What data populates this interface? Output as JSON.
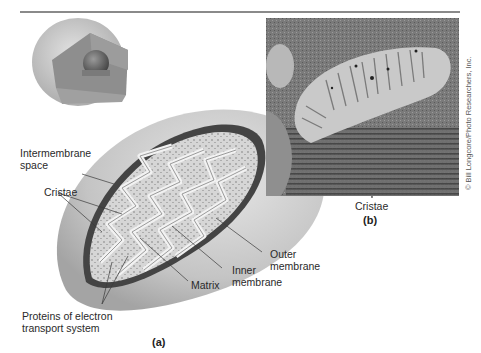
{
  "figure": {
    "panels": [
      {
        "id": "a",
        "label": "(a)",
        "type": "illustration",
        "subject": "mitochondrion cutaway",
        "labels": {
          "intermembrane_space_line1": "Intermembrane",
          "intermembrane_space_line2": "space",
          "cristae": "Cristae",
          "proteins_line1": "Proteins of electron",
          "proteins_line2": "transport system",
          "matrix": "Matrix",
          "inner_membrane_line1": "Inner",
          "inner_membrane_line2": "membrane",
          "outer_membrane_line1": "Outer",
          "outer_membrane_line2": "membrane"
        }
      },
      {
        "id": "b",
        "label": "(b)",
        "type": "electron-micrograph",
        "labels": {
          "cristae": "Cristae"
        },
        "credit": "© Bill Longcore/Photo Researchers, Inc."
      }
    ]
  }
}
